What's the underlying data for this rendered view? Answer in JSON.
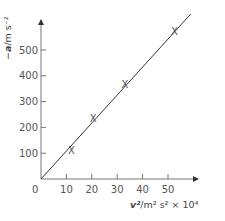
{
  "chart_data": {
    "type": "scatter",
    "title": "",
    "xlabel": "v²/m² s² × 10⁴",
    "ylabel": "−a/m s⁻²",
    "xlabel_parts": {
      "var": "v²",
      "unit": "/m² s² × 10⁴"
    },
    "ylabel_parts": {
      "sign": "−",
      "var": "a",
      "unit": "/m s⁻²"
    },
    "xlim": [
      0,
      60
    ],
    "ylim": [
      0,
      600
    ],
    "x_ticks": [
      10,
      20,
      30,
      40,
      50
    ],
    "y_ticks": [
      100,
      200,
      300,
      400,
      500
    ],
    "origin_label": "0",
    "marker": "x",
    "grid": false,
    "series": [
      {
        "name": "measured",
        "x": [
          12,
          20.5,
          33,
          52.5
        ],
        "y": [
          110,
          235,
          365,
          570
        ]
      }
    ],
    "best_fit_line": {
      "from": [
        0,
        0
      ],
      "to": [
        59,
        640
      ]
    },
    "colors": {
      "axis": "#555555",
      "line": "#333333",
      "marker": "#444444"
    }
  }
}
